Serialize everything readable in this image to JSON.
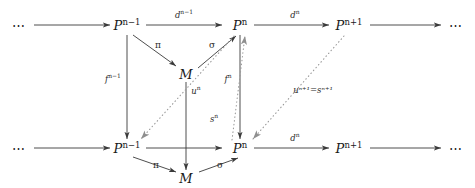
{
  "diagram": {
    "kind": "commutative-diagram",
    "background_color": "#ffffff",
    "line_color": "#3a3a3a",
    "dotted_color": "#9a9a9a",
    "text_color": "#1a1a1a",
    "ellipses": {
      "top_left": "⋯",
      "top_right": "⋯",
      "bottom_left": "⋯",
      "bottom_right": "⋯"
    },
    "nodes": [
      {
        "id": "top-p-n-minus-1",
        "base": "P",
        "exponent": "n−1",
        "x": 127,
        "y": 25,
        "row": "top"
      },
      {
        "id": "top-p-n",
        "base": "P",
        "exponent": "n",
        "x": 240,
        "y": 25,
        "row": "top"
      },
      {
        "id": "top-p-n-plus-1",
        "base": "P",
        "exponent": "n+1",
        "x": 349,
        "y": 25,
        "row": "top"
      },
      {
        "id": "top-m",
        "base": "M",
        "exponent": "",
        "x": 186,
        "y": 74,
        "row": "top"
      },
      {
        "id": "bottom-p-n-minus-1",
        "base": "P",
        "exponent": "n−1",
        "x": 127,
        "y": 148,
        "row": "bottom"
      },
      {
        "id": "bottom-p-n",
        "base": "P",
        "exponent": "n",
        "x": 240,
        "y": 148,
        "row": "bottom"
      },
      {
        "id": "bottom-p-n-plus-1",
        "base": "P",
        "exponent": "n+1",
        "x": 349,
        "y": 148,
        "row": "bottom"
      },
      {
        "id": "bottom-m",
        "base": "M",
        "exponent": "",
        "x": 186,
        "y": 178,
        "row": "bottom"
      }
    ],
    "edges": [
      {
        "id": "top-d-n-minus-1",
        "base": "d",
        "exponent": "n−1",
        "x": 184,
        "y": 14,
        "style": "solid"
      },
      {
        "id": "top-d-n",
        "base": "d",
        "exponent": "n",
        "x": 295,
        "y": 14,
        "style": "solid"
      },
      {
        "id": "bottom-d-n",
        "base": "d",
        "exponent": "n",
        "x": 295,
        "y": 137,
        "style": "solid"
      },
      {
        "id": "top-pi",
        "glyph": "π",
        "x": 158,
        "y": 45,
        "style": "solid"
      },
      {
        "id": "top-sigma",
        "glyph": "σ",
        "x": 212,
        "y": 45,
        "style": "solid"
      },
      {
        "id": "bottom-pi",
        "glyph": "π",
        "x": 156,
        "y": 165,
        "style": "solid"
      },
      {
        "id": "bottom-sigma",
        "glyph": "σ",
        "x": 220,
        "y": 165,
        "style": "solid"
      },
      {
        "id": "f-n-minus-1",
        "base": "f",
        "exponent": "n−1",
        "x": 113,
        "y": 78,
        "style": "solid"
      },
      {
        "id": "f-n",
        "base": "f",
        "exponent": "n",
        "x": 228,
        "y": 78,
        "style": "solid"
      },
      {
        "id": "u-n",
        "base": "u",
        "exponent": "n",
        "x": 196,
        "y": 90,
        "style": "solid"
      },
      {
        "id": "s-n",
        "base": "s",
        "exponent": "n",
        "x": 214,
        "y": 118,
        "style": "dotted"
      },
      {
        "id": "u-n-plus-1-equals-s-n-plus-1",
        "text": "uⁿ⁺¹=sⁿ⁺¹",
        "x": 313,
        "y": 90,
        "style": "dotted"
      }
    ]
  }
}
